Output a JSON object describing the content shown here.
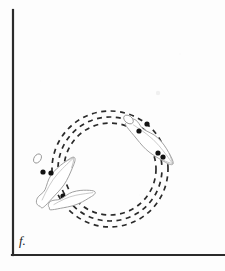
{
  "figure": {
    "panel_label": "f.",
    "caption_partial": "",
    "background_color": "#fdfdfd",
    "axis_color": "#2b2b2b",
    "dash_color": "#2a2a2a",
    "outline_color": "#9a9a9a",
    "dot_color": "#121212"
  },
  "axes": {
    "vertical": {
      "x": 13,
      "y_top": 10,
      "y_bottom": 255,
      "width": 2.2
    },
    "horizontal": {
      "y": 255,
      "x_left": 13,
      "x_right": 225,
      "width": 2.2
    }
  },
  "chart_data": {
    "type": "scatter",
    "title": "",
    "xlabel": "",
    "ylabel": "",
    "grid": false,
    "legend": null,
    "center": {
      "x": 110,
      "y": 169
    },
    "orbits": [
      {
        "name": "outer-orbit",
        "radius": 58,
        "dash": "5 4.5",
        "stroke_width": 1.7
      },
      {
        "name": "middle-orbit",
        "radius": 52,
        "dash": "5 4.5",
        "stroke_width": 1.7
      },
      {
        "name": "inner-orbit",
        "radius": 46,
        "dash": "5 4.5",
        "stroke_width": 1.7
      }
    ],
    "organisms": [
      {
        "name": "organism-upper-right",
        "angle_deg": -52,
        "anchor": {
          "x": 142,
          "y": 123
        },
        "rotation_deg": 38,
        "length": 60,
        "width": 17,
        "dots": [
          {
            "x": 147,
            "y": 124
          },
          {
            "x": 139,
            "y": 131
          },
          {
            "x": 158,
            "y": 153
          },
          {
            "x": 163,
            "y": 157
          }
        ]
      },
      {
        "name": "organism-left",
        "angle_deg": 196,
        "anchor": {
          "x": 50,
          "y": 160
        },
        "rotation_deg": -52,
        "length": 58,
        "width": 16,
        "dots": [
          {
            "x": 43,
            "y": 172
          },
          {
            "x": 51,
            "y": 173
          },
          {
            "x": 63,
            "y": 196
          },
          {
            "x": 69,
            "y": 203
          }
        ]
      },
      {
        "name": "organism-lower-left",
        "angle_deg": 140,
        "anchor": {
          "x": 60,
          "y": 190
        },
        "rotation_deg": -30,
        "length": 48,
        "width": 14,
        "dots": [
          {
            "x": 62,
            "y": 198
          },
          {
            "x": 72,
            "y": 206
          }
        ]
      }
    ],
    "dot_count_total": 10,
    "dot_radius": 2.6
  }
}
